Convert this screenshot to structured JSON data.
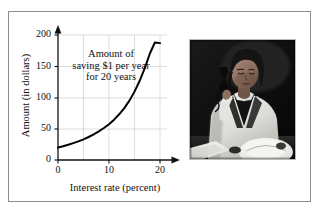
{
  "figure": {
    "border_color": "#8d8d8d",
    "background": "#ffffff"
  },
  "annotation": {
    "line1": "Amount of",
    "line2": "saving $1 per year",
    "line3": "for 20 years"
  },
  "photo": {
    "alt": "Woman in white lab coat talking on a telephone, black and white photograph",
    "caption": ""
  },
  "chart_data": {
    "type": "line",
    "title": "",
    "subtitle": "",
    "xlabel": "Interest rate (percent)",
    "ylabel": "Amount (in dollars)",
    "xlim": [
      0,
      20
    ],
    "ylim": [
      0,
      200
    ],
    "xticks": [
      0,
      10,
      20
    ],
    "xticklabels": [
      "0",
      "10",
      "20"
    ],
    "yticks": [
      0,
      50,
      100,
      150,
      200
    ],
    "yticklabels": [
      "0",
      "50",
      "100",
      "150",
      "200"
    ],
    "grid": true,
    "grid_x": [
      5,
      10,
      15,
      20
    ],
    "grid_y": [
      50,
      100,
      150,
      200
    ],
    "legend": null,
    "line_color": "#000000",
    "line_width": 2,
    "annotations": [
      "Amount of saving $1 per year for 20 years"
    ],
    "x": [
      0,
      1,
      2,
      3,
      4,
      5,
      6,
      7,
      8,
      9,
      10,
      11,
      12,
      13,
      14,
      15,
      16,
      17,
      18,
      19,
      20
    ],
    "y": [
      20,
      22,
      24.3,
      27,
      29.8,
      33.1,
      36.8,
      41,
      45.8,
      51.2,
      57.3,
      64.6,
      73.1,
      83.1,
      95,
      109.4,
      126.4,
      146.6,
      170,
      188,
      187
    ]
  }
}
